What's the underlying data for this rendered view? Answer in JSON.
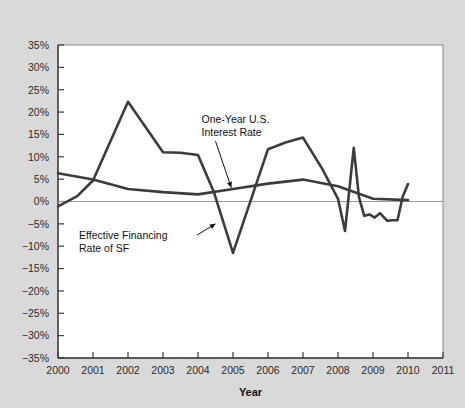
{
  "chart_data": {
    "type": "line",
    "title": "",
    "subtitle": "",
    "xlabel": "Year",
    "ylabel": "",
    "xlim": [
      2000,
      2011
    ],
    "ylim": [
      -35,
      35
    ],
    "grid": false,
    "legend_position": "inline-annotations",
    "x_tick_labels": [
      "2000",
      "2001",
      "2002",
      "2003",
      "2004",
      "2005",
      "2006",
      "2007",
      "2008",
      "2009",
      "2010",
      "2011"
    ],
    "y_tick_labels": [
      "35%",
      "30%",
      "25%",
      "20%",
      "15%",
      "10%",
      "5%",
      "0%",
      "−5%",
      "−10%",
      "−15%",
      "−20%",
      "−25%",
      "−30%",
      "−35%"
    ],
    "y_tick_values": [
      35,
      30,
      25,
      20,
      15,
      10,
      5,
      0,
      -5,
      -10,
      -15,
      -20,
      -25,
      -30,
      -35
    ],
    "zero_reference_line": 0,
    "series": [
      {
        "name": "Effective Financing Rate of SF",
        "color": "#3c3c3c",
        "x": [
          2000.0,
          2000.55,
          2001.0,
          2002.0,
          2003.0,
          2003.5,
          2004.0,
          2004.45,
          2005.0,
          2006.0,
          2006.5,
          2007.0,
          2007.55,
          2008.0,
          2008.2,
          2008.45,
          2008.6,
          2008.75,
          2008.9,
          2009.05,
          2009.2,
          2009.4,
          2009.55,
          2009.7,
          2009.85,
          2010.0
        ],
        "values": [
          -1.1,
          1.2,
          4.7,
          22.3,
          11.0,
          10.9,
          10.4,
          2.2,
          -11.5,
          11.7,
          13.2,
          14.3,
          7.3,
          0.6,
          -6.6,
          12.0,
          0.9,
          -3.2,
          -2.9,
          -3.6,
          -2.6,
          -4.3,
          -4.2,
          -4.2,
          1.1,
          3.9
        ]
      },
      {
        "name": "One-Year U.S. Interest Rate",
        "color": "#3c3c3c",
        "x": [
          2000.0,
          2001.0,
          2002.0,
          2003.0,
          2004.0,
          2005.0,
          2006.0,
          2007.0,
          2008.0,
          2009.0,
          2010.0
        ],
        "values": [
          6.3,
          4.9,
          2.8,
          2.1,
          1.6,
          2.8,
          4.0,
          4.9,
          3.4,
          0.6,
          0.3
        ]
      }
    ],
    "annotations": [
      {
        "id": "one-year-us-interest-rate",
        "lines": [
          "One-Year U.S.",
          "Interest Rate"
        ],
        "text_x": 2004.1,
        "text_y": 17.5,
        "arrow_to_x": 2004.95,
        "arrow_to_y": 3.1
      },
      {
        "id": "effective-financing-rate-of-sf",
        "lines": [
          "Effective Financing",
          "Rate of SF"
        ],
        "text_x": 2000.6,
        "text_y": -8.4,
        "arrow_to_x": 2004.5,
        "arrow_to_y": -5.0
      }
    ]
  }
}
